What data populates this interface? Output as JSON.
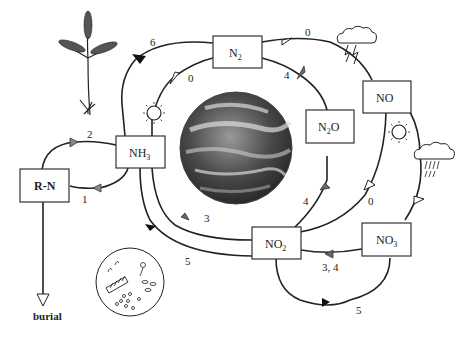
{
  "diagram": {
    "nodes": {
      "n2": {
        "label": "N",
        "sub": "2"
      },
      "no": {
        "label": "NO",
        "sub": ""
      },
      "n2o": {
        "label": "N",
        "sub": "2",
        "tail": "O"
      },
      "nh3": {
        "label": "NH",
        "sub": "3"
      },
      "rn": {
        "label": "R-N",
        "sub": ""
      },
      "no2": {
        "label": "NO",
        "sub": "2"
      },
      "no3": {
        "label": "NO",
        "sub": "3"
      }
    },
    "edge_labels": {
      "n2_to_nh3": "6",
      "nh3_to_n2_sun": "0",
      "n2_to_no_lightning": "0",
      "n2o_to_n2": "4",
      "rn_to_nh3": "2",
      "nh3_to_rn": "1",
      "no2_to_nh3": "3",
      "nh3_to_no2": "5",
      "no2_to_n2o": "4",
      "no_to_no2": "0",
      "no3_to_no2": "3, 4",
      "no2_to_no3": "5"
    },
    "burial_label": "burial",
    "icons": [
      "plant-icon",
      "sun-icon",
      "lightning-cloud-icon",
      "rain-cloud-icon",
      "earth-icon",
      "microbes-icon"
    ]
  }
}
